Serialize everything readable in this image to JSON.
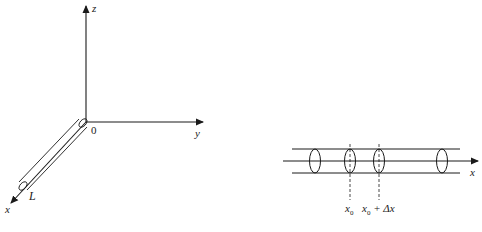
{
  "left_figure": {
    "description": "3D coordinate axes with a rod of length L along the x-axis",
    "axes": {
      "z_label": "z",
      "y_label": "y",
      "x_label": "x",
      "origin_label": "0"
    },
    "rod_label": "L"
  },
  "right_figure": {
    "description": "Rod along x-axis with cross-section ellipses and a slice between x0 and x0+Δx",
    "axis_label": "x",
    "marks": [
      {
        "label_base": "x",
        "label_sub": "0"
      },
      {
        "label_base": "x",
        "label_sub": "0",
        "label_suffix": " + Δx"
      }
    ]
  },
  "colors": {
    "line": "#1a1a1a",
    "background": "#ffffff"
  }
}
